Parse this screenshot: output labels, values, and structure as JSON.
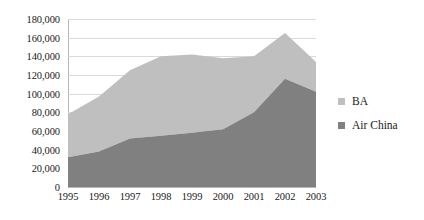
{
  "chart_data": {
    "type": "area",
    "stacked": true,
    "title": "",
    "subtitle": "",
    "xlabel": "",
    "ylabel": "",
    "categories": [
      "1995",
      "1996",
      "1997",
      "1998",
      "1999",
      "2000",
      "2001",
      "2002",
      "2003"
    ],
    "series": [
      {
        "name": "Air China",
        "color": "#808080",
        "values": [
          32000,
          38000,
          52000,
          55000,
          58000,
          62000,
          80000,
          116000,
          102000
        ]
      },
      {
        "name": "BA",
        "color": "#bfbfbf",
        "values": [
          46000,
          59000,
          73000,
          85000,
          84000,
          76000,
          60000,
          49000,
          32000
        ]
      }
    ],
    "stack_totals": [
      78000,
      97000,
      125000,
      140000,
      142000,
      138000,
      140000,
      165000,
      134000
    ],
    "ylim": [
      0,
      180000
    ],
    "ytick_labels": [
      "180,000",
      "160,000",
      "140,000",
      "120,000",
      "100,000",
      "80,000",
      "60,000",
      "40,000",
      "20,000",
      "0"
    ],
    "ytick_values": [
      180000,
      160000,
      140000,
      120000,
      100000,
      80000,
      60000,
      40000,
      20000,
      0
    ],
    "grid": true,
    "grid_color": "#d9d9d9",
    "legend_position": "right",
    "legend": [
      {
        "label": "BA",
        "color": "#bfbfbf"
      },
      {
        "label": "Air China",
        "color": "#808080"
      }
    ]
  }
}
